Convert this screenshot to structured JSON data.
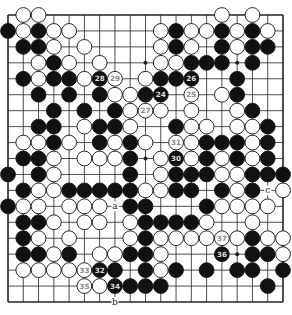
{
  "diagram": {
    "type": "go-board",
    "size": 19,
    "colors": {
      "black": "#111111",
      "white": "#ffffff",
      "line": "#222222",
      "background": "#ffffff"
    },
    "geometry": {
      "left": 8,
      "top": 15,
      "right": 283,
      "bottom": 302
    },
    "star_points": [
      [
        3,
        9
      ],
      [
        3,
        15
      ],
      [
        9,
        9
      ],
      [
        15,
        15
      ]
    ],
    "rows": [
      {
        "r": 0,
        "B": [],
        "W": [
          1,
          2,
          14,
          16
        ]
      },
      {
        "r": 1,
        "B": [
          0,
          2,
          11,
          14,
          16
        ],
        "W": [
          1,
          3,
          4,
          10,
          12,
          13,
          15,
          17
        ]
      },
      {
        "r": 2,
        "B": [
          1,
          2,
          11,
          14,
          16,
          17
        ],
        "W": [
          3,
          5,
          10,
          12,
          15
        ]
      },
      {
        "r": 3,
        "B": [
          3,
          12,
          13,
          14,
          16
        ],
        "W": [
          2,
          4,
          6,
          10,
          11
        ]
      },
      {
        "r": 4,
        "B": [
          1,
          3,
          4,
          6,
          10,
          11,
          12,
          15
        ],
        "W": [
          2,
          5,
          7,
          9
        ]
      },
      {
        "r": 5,
        "B": [
          2,
          4,
          6,
          9,
          10,
          15
        ],
        "W": [
          7,
          8,
          12,
          14
        ]
      },
      {
        "r": 6,
        "B": [
          3,
          5,
          7,
          16
        ],
        "W": [
          8,
          9,
          10,
          12,
          15
        ]
      },
      {
        "r": 7,
        "B": [
          2,
          3,
          6,
          7,
          11,
          17
        ],
        "W": [
          5,
          8,
          12,
          13,
          15,
          16
        ]
      },
      {
        "r": 8,
        "B": [
          3,
          6,
          8,
          13,
          14,
          15,
          17
        ],
        "W": [
          1,
          2,
          4,
          7,
          9,
          11,
          12,
          16
        ]
      },
      {
        "r": 9,
        "B": [
          1,
          2,
          8,
          11,
          13,
          15,
          17
        ],
        "W": [
          3,
          5,
          6,
          7,
          10,
          12,
          14,
          16
        ]
      },
      {
        "r": 10,
        "B": [
          0,
          2,
          8,
          11,
          12,
          13,
          16,
          17,
          18
        ],
        "W": [
          3,
          10,
          14,
          15
        ]
      },
      {
        "r": 11,
        "B": [
          1,
          4,
          5,
          6,
          7,
          8,
          11,
          12,
          14,
          16
        ],
        "W": [
          2,
          3,
          9,
          10,
          15,
          18
        ]
      },
      {
        "r": 12,
        "B": [
          0,
          8,
          9,
          13
        ],
        "W": [
          1,
          2,
          4,
          5,
          6,
          14,
          15,
          16,
          17
        ]
      },
      {
        "r": 13,
        "B": [
          1,
          2,
          9,
          10,
          11,
          12
        ],
        "W": [
          3,
          5,
          6,
          8,
          13,
          16
        ]
      },
      {
        "r": 14,
        "B": [
          1,
          9,
          16
        ],
        "W": [
          2,
          4,
          8,
          10,
          11,
          12,
          13,
          14,
          15,
          17,
          18
        ]
      },
      {
        "r": 15,
        "B": [
          1,
          2,
          4,
          8,
          9,
          14,
          16,
          17
        ],
        "W": [
          3,
          6,
          7,
          10,
          18
        ]
      },
      {
        "r": 16,
        "B": [
          6,
          7,
          9,
          11,
          13,
          15,
          16,
          18
        ],
        "W": [
          1,
          2,
          3,
          4,
          5,
          10
        ]
      },
      {
        "r": 17,
        "B": [
          7,
          8,
          9,
          10,
          17
        ],
        "W": [
          5,
          6
        ]
      },
      {
        "r": 18,
        "B": [],
        "W": []
      }
    ],
    "numbered_moves": [
      {
        "n": "24",
        "r": 5,
        "c": 10,
        "color": "B"
      },
      {
        "n": "25",
        "r": 5,
        "c": 12,
        "color": "W"
      },
      {
        "n": "26",
        "r": 4,
        "c": 12,
        "color": "B"
      },
      {
        "n": "27",
        "r": 6,
        "c": 9,
        "color": "W"
      },
      {
        "n": "28",
        "r": 4,
        "c": 6,
        "color": "B"
      },
      {
        "n": "29",
        "r": 4,
        "c": 7,
        "color": "W"
      },
      {
        "n": "30",
        "r": 9,
        "c": 11,
        "color": "B"
      },
      {
        "n": "31",
        "r": 8,
        "c": 11,
        "color": "W"
      },
      {
        "n": "32",
        "r": 16,
        "c": 6,
        "color": "B"
      },
      {
        "n": "33",
        "r": 16,
        "c": 5,
        "color": "W"
      },
      {
        "n": "34",
        "r": 17,
        "c": 7,
        "color": "B"
      },
      {
        "n": "35",
        "r": 17,
        "c": 5,
        "color": "W"
      },
      {
        "n": "36",
        "r": 15,
        "c": 14,
        "color": "B"
      },
      {
        "n": "37",
        "r": 14,
        "c": 14,
        "color": "W"
      }
    ],
    "letter_labels": [
      {
        "text": "a",
        "r": 12,
        "c": 7
      },
      {
        "text": "b",
        "r": 18,
        "c": 7
      },
      {
        "text": "c",
        "r": 11,
        "c": 17
      }
    ]
  }
}
